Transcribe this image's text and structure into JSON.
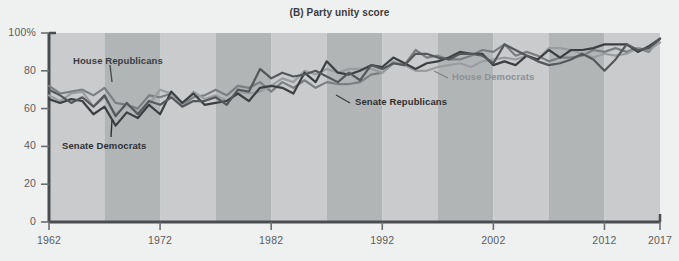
{
  "chart": {
    "title": "(B) Party unity score",
    "y_axis": {
      "ticks": [
        "0",
        "20",
        "40",
        "60",
        "80",
        "100%"
      ]
    },
    "x_axis": {
      "ticks": [
        "1962",
        "1972",
        "1982",
        "1992",
        "2002",
        "2012",
        "2017"
      ]
    },
    "labels": {
      "house_republicans": "House Republicans",
      "senate_democrats": "Senate Democrats",
      "house_democrats": "House Democrats",
      "senate_republicans": "Senate Republicans"
    }
  },
  "chart_data": {
    "type": "line",
    "title": "(B) Party unity score",
    "xlabel": "",
    "ylabel": "",
    "xlim": [
      1962,
      2017
    ],
    "ylim": [
      0,
      100
    ],
    "grid": false,
    "legend_position": "inline-annotations",
    "background_bands": {
      "description": "alternating vertical 5-year shaded bands",
      "light": "#c9cbcc",
      "dark": "#b2b5b6",
      "start_year": 1962,
      "band_width_years": 5
    },
    "colors": {
      "house_republicans": "#7b7f82",
      "senate_democrats": "#3c3f42",
      "house_democrats": "#9a9da0",
      "senate_republicans": "#55585b"
    },
    "x": [
      1962,
      1963,
      1964,
      1965,
      1966,
      1967,
      1968,
      1969,
      1970,
      1971,
      1972,
      1973,
      1974,
      1975,
      1976,
      1977,
      1978,
      1979,
      1980,
      1981,
      1982,
      1983,
      1984,
      1985,
      1986,
      1987,
      1988,
      1989,
      1990,
      1991,
      1992,
      1993,
      1994,
      1995,
      1996,
      1997,
      1998,
      1999,
      2000,
      2001,
      2002,
      2003,
      2004,
      2005,
      2006,
      2007,
      2008,
      2009,
      2010,
      2011,
      2012,
      2013,
      2014,
      2015,
      2016,
      2017
    ],
    "series": [
      {
        "name": "House Republicans",
        "values": [
          72,
          68,
          69,
          70,
          67,
          71,
          63,
          62,
          60,
          67,
          66,
          68,
          62,
          66,
          67,
          70,
          67,
          72,
          71,
          74,
          69,
          74,
          71,
          75,
          71,
          74,
          73,
          73,
          74,
          78,
          79,
          84,
          83,
          91,
          87,
          88,
          86,
          86,
          88,
          91,
          90,
          94,
          88,
          90,
          88,
          85,
          87,
          87,
          88,
          91,
          90,
          92,
          90,
          92,
          90,
          97
        ]
      },
      {
        "name": "House Democrats",
        "values": [
          67,
          64,
          68,
          69,
          61,
          66,
          57,
          62,
          58,
          62,
          70,
          68,
          62,
          69,
          65,
          67,
          64,
          69,
          68,
          69,
          72,
          76,
          74,
          80,
          78,
          81,
          79,
          81,
          81,
          81,
          79,
          85,
          83,
          80,
          80,
          82,
          83,
          84,
          82,
          85,
          86,
          87,
          86,
          88,
          86,
          92,
          92,
          91,
          89,
          87,
          89,
          88,
          89,
          92,
          91,
          95
        ]
      },
      {
        "name": "Senate Democrats",
        "values": [
          65,
          63,
          65,
          64,
          57,
          61,
          51,
          58,
          55,
          62,
          57,
          69,
          63,
          68,
          62,
          63,
          64,
          68,
          64,
          71,
          72,
          71,
          68,
          79,
          74,
          85,
          79,
          78,
          80,
          83,
          82,
          87,
          84,
          81,
          84,
          85,
          87,
          90,
          89,
          89,
          83,
          85,
          83,
          88,
          86,
          91,
          87,
          91,
          91,
          92,
          94,
          94,
          94,
          90,
          93,
          97
        ]
      },
      {
        "name": "Senate Republicans",
        "values": [
          70,
          67,
          63,
          66,
          61,
          67,
          56,
          63,
          57,
          64,
          62,
          66,
          61,
          64,
          64,
          66,
          62,
          70,
          69,
          81,
          76,
          79,
          77,
          78,
          80,
          77,
          74,
          79,
          75,
          83,
          81,
          84,
          83,
          89,
          89,
          87,
          86,
          89,
          89,
          88,
          84,
          94,
          91,
          88,
          85,
          83,
          84,
          86,
          89,
          86,
          80,
          86,
          94,
          91,
          92,
          97
        ]
      }
    ]
  }
}
